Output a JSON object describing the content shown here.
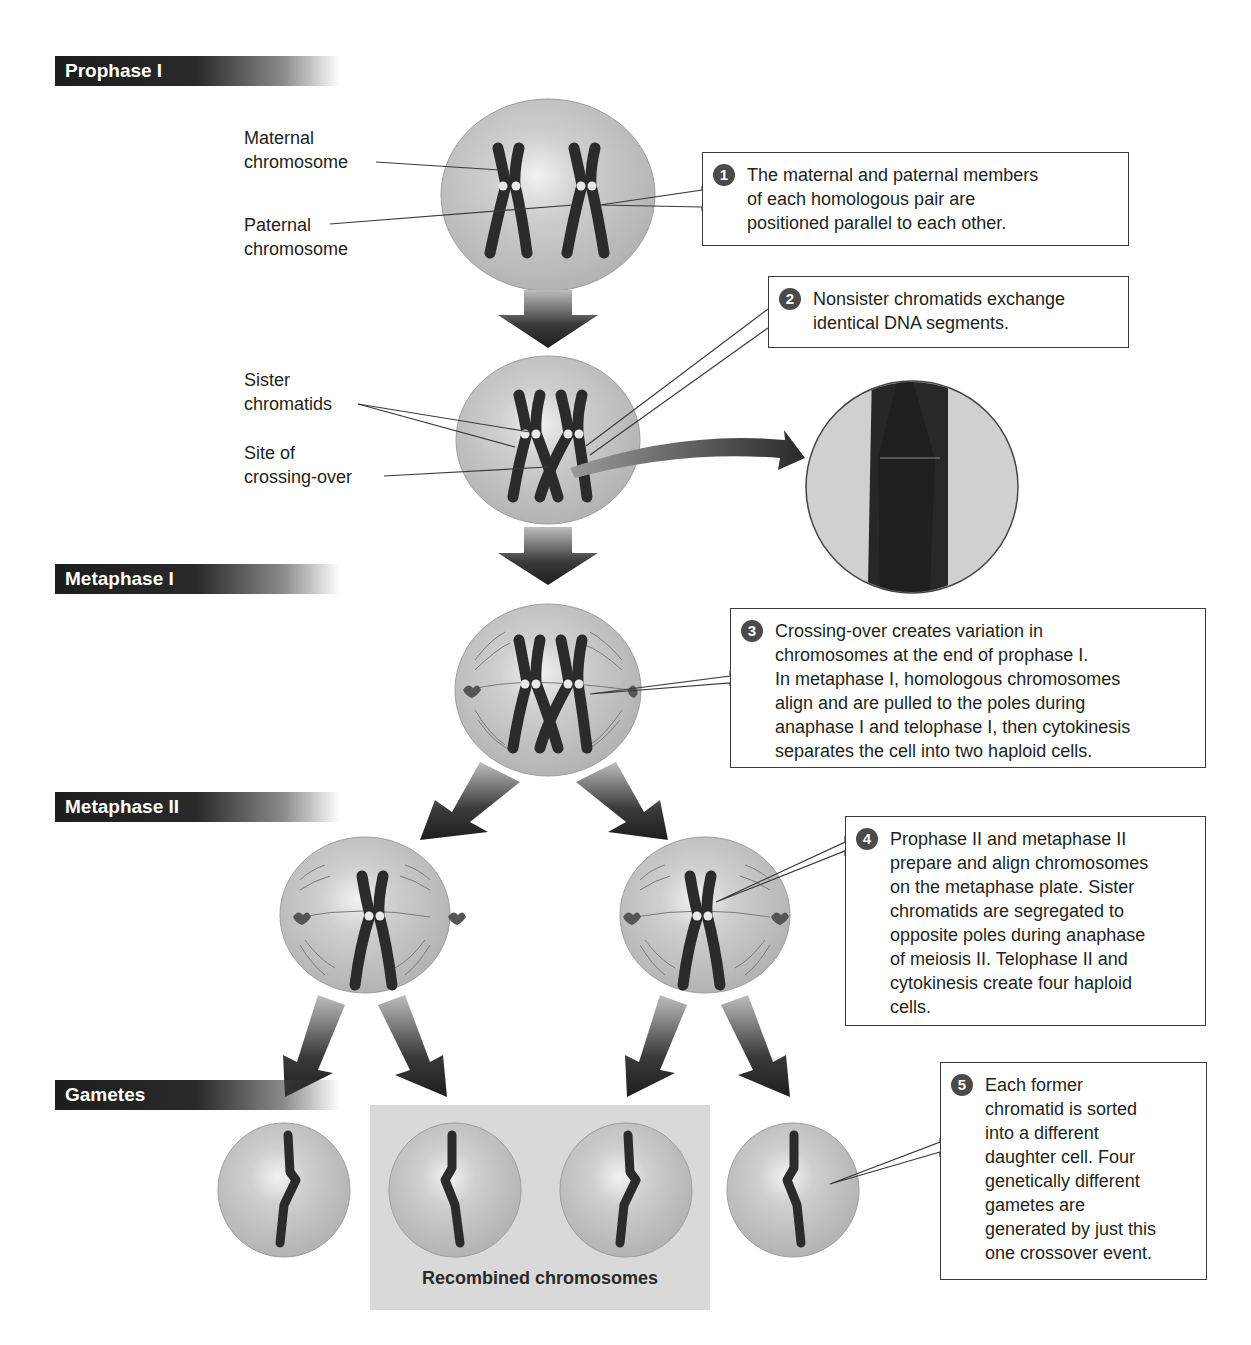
{
  "stages": [
    {
      "id": "prophase-1",
      "label": "Prophase I",
      "top": 56
    },
    {
      "id": "metaphase-1",
      "label": "Metaphase I",
      "top": 564
    },
    {
      "id": "metaphase-2",
      "label": "Metaphase II",
      "top": 792
    },
    {
      "id": "gametes",
      "label": "Gametes",
      "top": 1080
    }
  ],
  "labels": {
    "maternal_line1": "Maternal",
    "maternal_line2": "chromosome",
    "paternal_line1": "Paternal",
    "paternal_line2": "chromosome",
    "sister_line1": "Sister",
    "sister_line2": "chromatids",
    "crossing_line1": "Site of",
    "crossing_line2": "crossing-over",
    "recombined": "Recombined chromosomes"
  },
  "callouts": [
    {
      "number": "1",
      "lines": [
        "The maternal and paternal members",
        "of each homologous pair are",
        "positioned parallel to each other."
      ]
    },
    {
      "number": "2",
      "lines": [
        "Nonsister chromatids exchange",
        "identical DNA segments."
      ]
    },
    {
      "number": "3",
      "lines": [
        "Crossing-over creates variation in",
        "chromosomes at the end of prophase I.",
        "In metaphase I, homologous chromosomes",
        "align and are pulled to the poles during",
        "anaphase I and telophase I, then cytokinesis",
        "separates the cell into two haploid cells."
      ]
    },
    {
      "number": "4",
      "lines": [
        "Prophase II and metaphase II",
        "prepare and align chromosomes",
        "on the metaphase plate. Sister",
        "chromatids are segregated to",
        "opposite poles during anaphase",
        "of meiosis II. Telophase II and",
        "cytokinesis create four haploid",
        "cells."
      ]
    },
    {
      "number": "5",
      "lines": [
        "Each former",
        "chromatid is sorted",
        "into a different",
        "daughter cell. Four",
        "genetically different",
        "gametes are",
        "generated by just this",
        "one crossover event."
      ]
    }
  ],
  "colors": {
    "cell_fill": "#c9c9c9",
    "chromosome": "#2b2b2b",
    "stage_bar": "#1d1d1d",
    "recombined_bg": "#d9d9d9"
  }
}
